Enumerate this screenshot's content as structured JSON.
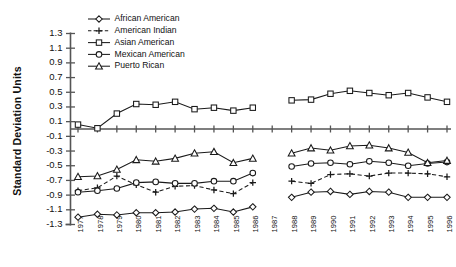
{
  "chart_data": {
    "type": "line",
    "title": "",
    "xlabel": "",
    "ylabel": "Standard Deviation Units",
    "ylim": [
      -1.3,
      1.3
    ],
    "ytick_labels": [
      "1.3",
      "1.1",
      "0.9",
      "0.7",
      "0.5",
      "0.3",
      "0.1",
      "-0.1",
      "-0.3",
      "-0.5",
      "-0.7",
      "-0.9",
      "-1.1",
      "-1.3"
    ],
    "ytick_values": [
      1.3,
      1.1,
      0.9,
      0.7,
      0.5,
      0.3,
      0.1,
      -0.1,
      -0.3,
      -0.5,
      -0.7,
      -0.9,
      -1.1,
      -1.3
    ],
    "grid": false,
    "legend_position": "top-left",
    "zero_line": 0,
    "gap_note": "No data plotted for 1987",
    "categories": [
      "1977",
      "1978",
      "1979",
      "1980",
      "1981",
      "1982",
      "1983",
      "1984",
      "1985",
      "1986",
      "1987",
      "1988",
      "1989",
      "1990",
      "1991",
      "1992",
      "1993",
      "1994",
      "1995",
      "1996"
    ],
    "x": [
      1977,
      1978,
      1979,
      1980,
      1981,
      1982,
      1983,
      1984,
      1985,
      1986,
      1987,
      1988,
      1989,
      1990,
      1991,
      1992,
      1993,
      1994,
      1995,
      1996
    ],
    "series": [
      {
        "name": "African American",
        "marker": "diamond",
        "linestyle": "solid",
        "values": [
          -1.2,
          -1.16,
          -1.17,
          -1.14,
          -1.14,
          -1.13,
          -1.09,
          -1.08,
          -1.13,
          -1.06,
          null,
          -0.93,
          -0.86,
          -0.85,
          -0.89,
          -0.85,
          -0.86,
          -0.93,
          -0.93,
          -0.93
        ]
      },
      {
        "name": "American Indian",
        "marker": "plus",
        "linestyle": "dashed",
        "values": [
          -0.84,
          -0.8,
          -0.64,
          -0.76,
          -0.86,
          -0.78,
          -0.77,
          -0.83,
          -0.88,
          -0.73,
          null,
          -0.71,
          -0.74,
          -0.62,
          -0.61,
          -0.64,
          -0.6,
          -0.6,
          -0.61,
          -0.65
        ]
      },
      {
        "name": "Asian American",
        "marker": "square",
        "linestyle": "solid",
        "values": [
          0.06,
          0.01,
          0.21,
          0.34,
          0.33,
          0.37,
          0.27,
          0.29,
          0.25,
          0.29,
          null,
          0.39,
          0.4,
          0.48,
          0.52,
          0.49,
          0.46,
          0.49,
          0.43,
          0.37
        ]
      },
      {
        "name": "Mexican American",
        "marker": "circle",
        "linestyle": "solid",
        "values": [
          -0.86,
          -0.84,
          -0.81,
          -0.73,
          -0.72,
          -0.74,
          -0.74,
          -0.71,
          -0.71,
          -0.6,
          null,
          -0.51,
          -0.47,
          -0.46,
          -0.48,
          -0.44,
          -0.46,
          -0.5,
          -0.47,
          -0.45
        ]
      },
      {
        "name": "Puerto Rican",
        "marker": "triangle",
        "linestyle": "solid",
        "values": [
          -0.65,
          -0.64,
          -0.55,
          -0.42,
          -0.44,
          -0.4,
          -0.33,
          -0.31,
          -0.46,
          -0.4,
          null,
          -0.33,
          -0.26,
          -0.29,
          -0.23,
          -0.22,
          -0.26,
          -0.32,
          -0.46,
          -0.43
        ]
      }
    ]
  }
}
